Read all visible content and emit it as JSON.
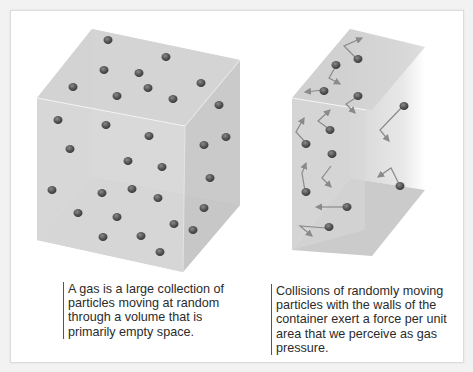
{
  "figure": {
    "panels": [
      {
        "id": "gas-volume",
        "caption_lines": [
          "A gas is a large collection of",
          "particles moving at random",
          "through a volume that is",
          "primarily empty space."
        ]
      },
      {
        "id": "gas-pressure",
        "caption_lines": [
          "Collisions of randomly moving",
          "particles with the walls of the",
          "container exert a force per unit",
          "area that we perceive as gas",
          "pressure."
        ]
      }
    ],
    "colors": {
      "box_face": "#d9d9d9",
      "box_top": "#cfcfcf",
      "box_side": "#c4c4c4",
      "particle": "#5a5a5a",
      "arrow": "#8a8a8a",
      "caption_text": "#2b2b2b",
      "caption_rule": "#555555"
    }
  }
}
